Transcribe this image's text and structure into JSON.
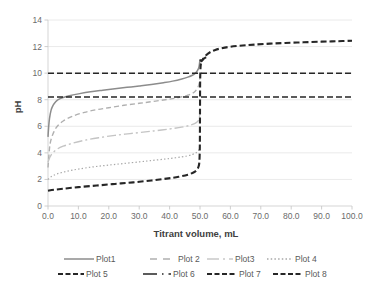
{
  "chart_data": {
    "type": "line",
    "title": "",
    "xlabel": "Titrant volume, mL",
    "ylabel": "pH",
    "xlim": [
      0,
      100
    ],
    "ylim": [
      0,
      14
    ],
    "grid": true,
    "legend_position": "bottom",
    "xticks": [
      "0.0",
      "10.0",
      "20.0",
      "30.0",
      "40.0",
      "50.0",
      "60.0",
      "70.0",
      "80.0",
      "90.0",
      "100.0"
    ],
    "xtick_values": [
      0,
      10,
      20,
      30,
      40,
      50,
      60,
      70,
      80,
      90,
      100
    ],
    "yticks": [
      "0",
      "2",
      "4",
      "6",
      "8",
      "10",
      "12",
      "14"
    ],
    "ytick_values": [
      0,
      2,
      4,
      6,
      8,
      10,
      12,
      14
    ],
    "series": [
      {
        "name": "Plot1",
        "color": "#8c8c8c",
        "width": 1.5,
        "dash": "none",
        "x": [
          0,
          0.2,
          0.5,
          1,
          1.5,
          2,
          3,
          4,
          5,
          7,
          10,
          14,
          18,
          22,
          26,
          30,
          34,
          38,
          41,
          44,
          46,
          47.5,
          48.5,
          49.2,
          49.7,
          50
        ],
        "y": [
          5.2,
          5.9,
          6.6,
          7.2,
          7.5,
          7.7,
          7.95,
          8.08,
          8.17,
          8.3,
          8.44,
          8.6,
          8.72,
          8.83,
          8.93,
          9.03,
          9.14,
          9.28,
          9.4,
          9.56,
          9.7,
          9.84,
          10.0,
          10.2,
          10.5,
          11.05
        ]
      },
      {
        "name": "Plot 2",
        "color": "#b0b0b0",
        "width": 1.4,
        "dash": "5,3",
        "x": [
          0,
          0.5,
          1,
          2,
          3,
          5,
          8,
          12,
          16,
          20,
          25,
          30,
          34,
          38,
          41,
          44,
          46,
          47.5,
          48.5,
          49.3,
          49.8,
          50
        ],
        "y": [
          2.9,
          4.35,
          5.0,
          5.62,
          5.98,
          6.4,
          6.75,
          7.05,
          7.25,
          7.4,
          7.58,
          7.73,
          7.85,
          7.98,
          8.08,
          8.22,
          8.34,
          8.48,
          8.66,
          8.92,
          9.3,
          9.8
        ]
      },
      {
        "name": "Plot3",
        "color": "#c4c4c4",
        "width": 1.4,
        "dash": "9,3,2,3",
        "x": [
          0,
          0.3,
          0.8,
          1.5,
          3,
          5,
          8,
          12,
          17,
          22,
          27,
          32,
          36,
          40,
          43,
          45.5,
          47,
          48.2,
          49,
          49.6,
          50
        ],
        "y": [
          3.3,
          3.5,
          3.75,
          3.98,
          4.28,
          4.5,
          4.72,
          4.95,
          5.15,
          5.32,
          5.45,
          5.58,
          5.68,
          5.8,
          5.9,
          6.0,
          6.1,
          6.2,
          6.32,
          6.5,
          6.95
        ]
      },
      {
        "name": "Plot 4",
        "color": "#a8a8a8",
        "width": 1.2,
        "dash": "1.4,2.2",
        "x": [
          0,
          1,
          3,
          6,
          10,
          15,
          20,
          25,
          30,
          34,
          38,
          41,
          44,
          46,
          47.5,
          48.5,
          49.2,
          49.7,
          50
        ],
        "y": [
          2.0,
          2.2,
          2.42,
          2.6,
          2.78,
          2.95,
          3.08,
          3.2,
          3.32,
          3.42,
          3.52,
          3.6,
          3.7,
          3.78,
          3.88,
          3.98,
          4.1,
          4.25,
          4.45
        ]
      },
      {
        "name": "Plot 5",
        "color": "#262626",
        "width": 2.1,
        "dash": "6,3",
        "x": [
          0,
          2,
          5,
          10,
          16,
          22,
          28,
          34,
          39,
          43,
          46,
          48,
          49,
          49.5,
          49.8,
          49.95,
          50,
          50.05,
          50.2,
          50.5,
          51,
          52
        ],
        "y": [
          1.15,
          1.22,
          1.3,
          1.42,
          1.54,
          1.66,
          1.78,
          1.92,
          2.06,
          2.2,
          2.36,
          2.54,
          2.74,
          2.95,
          3.35,
          4.6,
          7.0,
          9.4,
          10.5,
          10.85,
          11.05,
          11.2
        ]
      },
      {
        "name": "Plot 6",
        "color": "#262626",
        "width": 1.4,
        "dash": "6,3",
        "x": [
          0,
          100
        ],
        "y": [
          8.2,
          8.2
        ]
      },
      {
        "name": "Plot 7",
        "color": "#262626",
        "width": 2.1,
        "dash": "6,3",
        "x": [
          50,
          50.5,
          51,
          52,
          53.5,
          55,
          57,
          60,
          64,
          68,
          73,
          78,
          84,
          90,
          95,
          100
        ],
        "y": [
          11.0,
          10.9,
          11.05,
          11.35,
          11.6,
          11.75,
          11.87,
          11.99,
          12.08,
          12.15,
          12.22,
          12.27,
          12.32,
          12.37,
          12.4,
          12.44
        ]
      },
      {
        "name": "Plot 8",
        "color": "#262626",
        "width": 1.5,
        "dash": "6,3",
        "x": [
          0,
          100
        ],
        "y": [
          10.0,
          10.0
        ]
      }
    ]
  },
  "legend": {
    "rows": [
      [
        {
          "label": "Plot1",
          "style": "solid-gray"
        },
        {
          "label": "Plot 2",
          "style": "dashed-gray"
        },
        {
          "label": "Plot3",
          "style": "dashdot-light"
        },
        {
          "label": "Plot 4",
          "style": "dotted-gray"
        }
      ],
      [
        {
          "label": "Plot 5",
          "style": "heavy-dashed-dark"
        },
        {
          "label": "Plot 6",
          "style": "solid-dot-dark"
        },
        {
          "label": "Plot 7",
          "style": "dashed-dark"
        },
        {
          "label": "Plot 8",
          "style": "dashed-dark"
        }
      ]
    ]
  }
}
